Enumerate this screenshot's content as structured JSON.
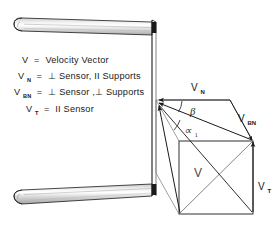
{
  "figure": {
    "background_color": "#ffffff",
    "line_color": "#1a1a1a"
  },
  "legend": {
    "items": [
      {
        "symbol": "V",
        "subscript": "",
        "equals": "=",
        "definition": "Velocity  Vector"
      },
      {
        "symbol": "V",
        "subscript": "N",
        "equals": "=",
        "definition": "⊥ Sensor, II Supports"
      },
      {
        "symbol": "V",
        "subscript": "BN",
        "equals": "=",
        "definition": "⊥ Sensor ,⊥ Supports"
      },
      {
        "symbol": "V",
        "subscript": "T",
        "equals": "=",
        "definition": "II Sensor"
      }
    ]
  },
  "vector_diagram": {
    "labels": [
      {
        "name": "vn-label",
        "symbol": "V",
        "subscript": "N"
      },
      {
        "name": "vbn-label",
        "symbol": "V",
        "subscript": "BN"
      },
      {
        "name": "vt-label",
        "symbol": "V",
        "subscript": "T"
      },
      {
        "name": "v-label",
        "symbol": "V",
        "subscript": ""
      }
    ],
    "angles": [
      {
        "name": "beta-angle",
        "symbol": "β",
        "subscript": ""
      },
      {
        "name": "alpha-angle",
        "symbol": "∝",
        "subscript": "1"
      }
    ]
  },
  "apparatus": {
    "parts": [
      {
        "name": "upper-sensor-cone",
        "shading": "#d8d8d8"
      },
      {
        "name": "lower-sensor-cone",
        "shading": "#d8d8d8"
      },
      {
        "name": "support-wall",
        "shading": "#ffffff"
      }
    ]
  }
}
